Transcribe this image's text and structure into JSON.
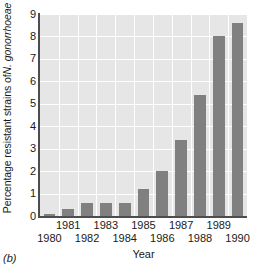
{
  "panel_label": "(b)",
  "axes": {
    "ylabel_prefix": "Percentage resistant strains of ",
    "ylabel_species": "N. gonorrhoeae",
    "ylabel_full": "Percentage resistant strains of N. gonorrhoeae",
    "xlabel": "Year",
    "yticks": [
      "0",
      "1",
      "2",
      "3",
      "4",
      "5",
      "6",
      "7",
      "8",
      "9"
    ],
    "xticks": [
      "1980",
      "1981",
      "1982",
      "1983",
      "1984",
      "1985",
      "1986",
      "1987",
      "1988",
      "1989",
      "1990"
    ]
  },
  "colors": {
    "bar": "#808080",
    "plot_background": "#e6e6e6",
    "gridline": "#ffffff",
    "axis": "#4d4d4d",
    "text": "#1a1a1a",
    "page_background": "#ffffff"
  },
  "chart_data": {
    "type": "bar",
    "title": "",
    "subtitle": "",
    "panel": "(b)",
    "categories": [
      "1980",
      "1981",
      "1982",
      "1983",
      "1984",
      "1985",
      "1986",
      "1987",
      "1988",
      "1989",
      "1990"
    ],
    "values": [
      0.1,
      0.3,
      0.6,
      0.6,
      0.6,
      1.2,
      2.0,
      3.4,
      5.4,
      8.0,
      8.6
    ],
    "xlabel": "Year",
    "ylabel": "Percentage resistant strains of N. gonorrhoeae",
    "ylim": [
      0,
      9
    ],
    "ytick_step": 1,
    "grid": true,
    "grid_orientation": "both",
    "legend": false,
    "legend_position": "none",
    "xtick_stagger": true,
    "bar_color": "#808080"
  }
}
